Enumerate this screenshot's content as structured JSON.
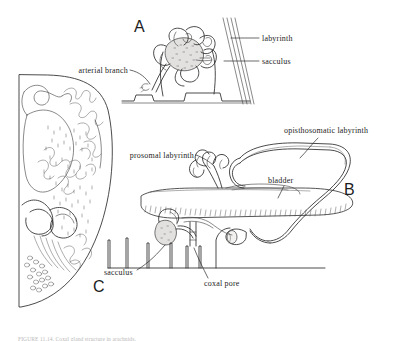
{
  "figure": {
    "background_color": "#ffffff",
    "ink_color": "#2b2b2b",
    "sacculus_fill_color": "#e3e1e0",
    "caption": "FIGURE 11.14.  Coxal gland structure in arachnids."
  },
  "panels": [
    {
      "id": "A",
      "letter": "A",
      "description": "Sectional view of coxal gland with sacculus and labyrinth"
    },
    {
      "id": "B",
      "letter": "B",
      "description": "Lateral view showing prosomal and opisthosomatic labyrinth, bladder, sacculus and coxal pore"
    },
    {
      "id": "C",
      "letter": "C",
      "description": "Detailed whole-organ drawing in outline"
    }
  ],
  "labels": {
    "panel_a": [
      {
        "id": "labyrinth",
        "text": "labyrinth",
        "x": 262,
        "y": 41
      },
      {
        "id": "sacculus",
        "text": "sacculus",
        "x": 262,
        "y": 64
      },
      {
        "id": "arterial_branch",
        "text": "arterial branch",
        "x": 66,
        "y": 72
      }
    ],
    "panel_b": [
      {
        "id": "opisthosomatic-labyrinth",
        "text": "opisthosomatic labyrinth",
        "x": 284,
        "y": 132
      },
      {
        "id": "prosomal-labyrinth",
        "text": "prosomal labyrinth",
        "x": 116,
        "y": 158
      },
      {
        "id": "bladder",
        "text": "bladder",
        "x": 268,
        "y": 182
      },
      {
        "id": "sacculus",
        "text": "sacculus",
        "x": 106,
        "y": 274
      },
      {
        "id": "coxal-pore",
        "text": "coxal pore",
        "x": 205,
        "y": 283
      }
    ]
  }
}
